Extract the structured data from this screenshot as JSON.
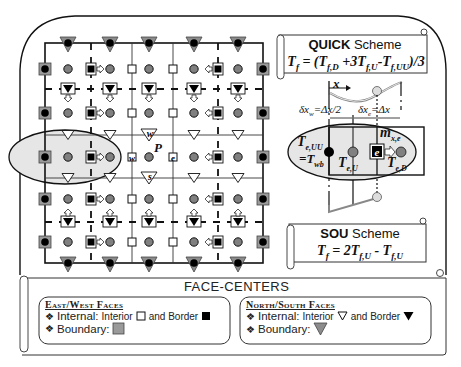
{
  "colors": {
    "ink": "#111111",
    "cell_circle": "#808080",
    "boundary_square": "#9a9a9a",
    "boundary_triangle": "#8c8c8c",
    "stencil_fill": "#e6e6e6",
    "black": "#000000",
    "white": "#ffffff"
  },
  "grid": {
    "left": 45,
    "right": 263,
    "top": 43,
    "bottom": 263,
    "vertical_solid": [
      132,
      173
    ],
    "vertical_dashed": [
      91,
      218
    ],
    "horizontal_solid": [
      135,
      178
    ],
    "horizontal_dashed": [
      89,
      222
    ],
    "cell_x": [
      68,
      110,
      149,
      194,
      238
    ],
    "cell_y": [
      69,
      113,
      157,
      199,
      242
    ],
    "boundary_squares_x": [
      45,
      263
    ],
    "boundary_triangles_y": [
      43,
      263
    ],
    "interior_ew_faces_x": [
      132,
      173
    ],
    "border_ew_faces_x": [
      91,
      218
    ],
    "interior_ns_faces_y": [
      135,
      178
    ],
    "border_ns_faces_y": [
      89,
      222
    ],
    "east_arrow_cols_left": true,
    "center_labels": {
      "P": "P",
      "w": "w",
      "e": "e",
      "n": "n",
      "s": "s"
    }
  },
  "stencil_ellipse": {
    "cx": 65,
    "cy": 157,
    "rx": 56,
    "ry": 27
  },
  "quick_scheme": {
    "title_bold": "QUICK",
    "title_rest": " Scheme",
    "formula_parts": [
      {
        "t": "T",
        "sub": "f"
      },
      {
        "t": " = (T",
        "sub": "f,D"
      },
      {
        "t": " +3T",
        "sub": "f,U"
      },
      {
        "t": "-T",
        "sub": "f,UU"
      },
      {
        "t": ")/3",
        "sub": ""
      }
    ]
  },
  "detail": {
    "x_label": "x",
    "dx_w_label": "δx",
    "dx_w_sub": "w",
    "dx_w_value": "=Δx/2",
    "dx_e_label": "δx",
    "dx_e_sub": "e",
    "dx_e_value": "=Δx",
    "T_eUU": "T",
    "T_eUU_sub": "e,UU",
    "T_wb": "=T",
    "T_wb_sub": "wb",
    "T_eU": "T",
    "T_eU_sub": "e,U",
    "T_eD": "T",
    "T_eD_sub": "e,D",
    "m_xe": "m",
    "m_xe_sub": "x,e",
    "e_label": "e"
  },
  "sou_scheme": {
    "title_bold": "SOU",
    "title_rest": " Scheme",
    "formula_parts": [
      {
        "t": "T",
        "sub": "f"
      },
      {
        "t": " = 2T",
        "sub": "f,U"
      },
      {
        "t": " - T",
        "sub": "f,U"
      }
    ]
  },
  "legend": {
    "title": "FACE-CENTERS",
    "east_west": {
      "heading": "East/West Faces",
      "internal_label": "Internal:",
      "interior_label": "Interior",
      "and_border_label": "and Border",
      "boundary_label": "Boundary:"
    },
    "north_south": {
      "heading": "North/South Faces",
      "internal_label": "Internal:",
      "interior_label": "Interior",
      "and_border_label": "and Border",
      "boundary_label": "Boundary:"
    },
    "bullet": "❖"
  }
}
